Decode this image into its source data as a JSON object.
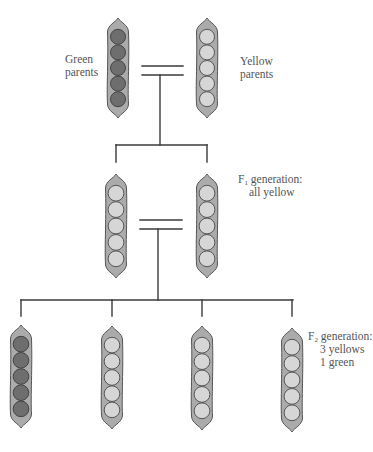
{
  "diagram": {
    "colors": {
      "line": "#3a3a3a",
      "pod_fill": "#ababab",
      "pod_stroke": "#555555",
      "green_pea_fill": "#6e6e6e",
      "green_pea_stroke": "#444444",
      "yellow_pea_fill": "#d6d6d6",
      "yellow_pea_stroke": "#555555",
      "text": "#555555"
    },
    "labels": {
      "parents_green": {
        "line1": "Green",
        "line2": "parents"
      },
      "parents_yellow": {
        "line1": "Yellow",
        "line2": "parents"
      },
      "f1": {
        "prefix": "F",
        "sub": "1",
        "line1_rest": " generation:",
        "line2": "all yellow"
      },
      "f2": {
        "prefix": "F",
        "sub": "2",
        "line1_rest": " generation:",
        "line2": "3 yellows",
        "line3": "1 green"
      }
    },
    "generations": [
      {
        "name": "Parents",
        "pods": [
          {
            "id": "parent-green",
            "color": "green",
            "peas": 5,
            "cx": 118,
            "top": 18,
            "bottom": 118
          },
          {
            "id": "parent-yellow",
            "color": "yellow",
            "peas": 5,
            "cx": 207,
            "top": 18,
            "bottom": 118
          }
        ],
        "cross_symbol": {
          "x1": 142,
          "x2": 183,
          "y1": 66,
          "y2": 75,
          "stem_x": 160
        }
      },
      {
        "name": "F1",
        "pods": [
          {
            "id": "f1-left",
            "color": "yellow",
            "peas": 5,
            "cx": 116,
            "top": 174,
            "bottom": 278
          },
          {
            "id": "f1-right",
            "color": "yellow",
            "peas": 5,
            "cx": 207,
            "top": 174,
            "bottom": 278
          }
        ],
        "branch": {
          "y": 145,
          "x1": 116,
          "x2": 207,
          "drop_to": 162
        },
        "cross_symbol": {
          "x1": 140,
          "x2": 182,
          "y1": 220,
          "y2": 229,
          "stem_x": 158
        }
      },
      {
        "name": "F2",
        "pods": [
          {
            "id": "f2-1",
            "color": "green",
            "peas": 5,
            "cx": 21,
            "top": 325,
            "bottom": 428
          },
          {
            "id": "f2-2",
            "color": "yellow",
            "peas": 5,
            "cx": 112,
            "top": 326,
            "bottom": 429
          },
          {
            "id": "f2-3",
            "color": "yellow",
            "peas": 5,
            "cx": 202,
            "top": 326,
            "bottom": 430
          },
          {
            "id": "f2-4",
            "color": "yellow",
            "peas": 5,
            "cx": 292,
            "top": 328,
            "bottom": 432
          }
        ],
        "branch": {
          "y": 300,
          "x1": 21,
          "x2": 293,
          "drop_to": 316
        }
      }
    ],
    "ratio": {
      "yellow": 3,
      "green": 1
    }
  }
}
